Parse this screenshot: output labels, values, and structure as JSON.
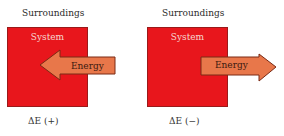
{
  "diagram": {
    "colors": {
      "system_fill": "#e8161c",
      "system_border": "#9a1a1a",
      "arrow_fill": "#e8774a",
      "arrow_stroke": "#7a2a14",
      "background": "#ffffff"
    },
    "panels": [
      {
        "surroundings_label": "Surroundings",
        "system_label": "System",
        "arrow_label": "Energy",
        "arrow_direction": "into-system",
        "delta_symbol": "ΔE",
        "delta_sign": "(+)"
      },
      {
        "surroundings_label": "Surroundings",
        "system_label": "System",
        "arrow_label": "Energy",
        "arrow_direction": "out-of-system",
        "delta_symbol": "ΔE",
        "delta_sign": "(−)"
      }
    ]
  }
}
